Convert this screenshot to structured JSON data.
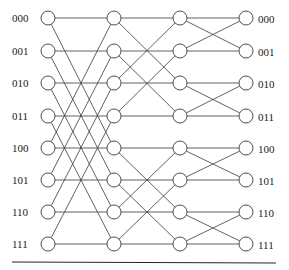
{
  "diagram": {
    "type": "butterfly-network",
    "stages": 3,
    "columns_x": [
      48,
      114,
      180,
      246
    ],
    "rows_y": [
      18,
      51,
      83,
      116,
      148,
      180,
      212,
      244
    ],
    "node_radius": 7,
    "left_labels": [
      "000",
      "001",
      "010",
      "011",
      "100",
      "101",
      "110",
      "111"
    ],
    "right_labels": [
      "000",
      "001",
      "010",
      "011",
      "100",
      "101",
      "110",
      "111"
    ],
    "stage_xor_masks": [
      4,
      2,
      1
    ],
    "line_color": "#3a3a3a",
    "node_stroke": "#3a3a3a",
    "baseline": {
      "x1": 12,
      "x2": 276,
      "y": 262
    }
  }
}
